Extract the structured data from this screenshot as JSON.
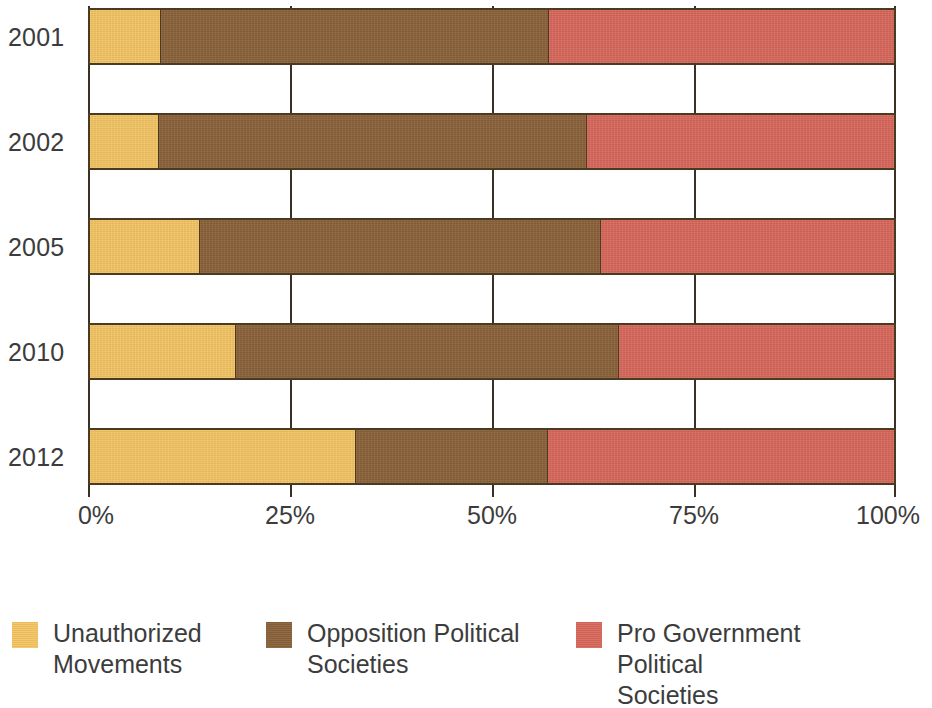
{
  "chart_data": {
    "type": "bar",
    "orientation": "horizontal",
    "stacked": true,
    "normalized": true,
    "title": "",
    "subtitle": "",
    "xlabel": "",
    "ylabel": "",
    "categories": [
      "2001",
      "2002",
      "2005",
      "2010",
      "2012"
    ],
    "xticklabels": [
      "0%",
      "25%",
      "50%",
      "75%",
      "100%"
    ],
    "xtickvalues": [
      0,
      25,
      50,
      75,
      100
    ],
    "xlim": [
      0,
      100
    ],
    "grid": true,
    "grid_axis": "x",
    "legend_position": "bottom",
    "series": [
      {
        "name": "Unauthorized Movements",
        "color": "#F5C564",
        "values": [
          8.7,
          8.5,
          13.5,
          18.0,
          33.0
        ]
      },
      {
        "name": "Opposition Political Societies",
        "color": "#8A6239",
        "values": [
          48.3,
          53.2,
          49.9,
          47.7,
          23.9
        ]
      },
      {
        "name": "Pro Government Political Societies",
        "color": "#D9685C",
        "values": [
          43.0,
          38.3,
          36.6,
          34.3,
          43.1
        ]
      }
    ]
  },
  "axis": {
    "ticks": [
      {
        "label": "0%",
        "value": 0
      },
      {
        "label": "25%",
        "value": 25
      },
      {
        "label": "50%",
        "value": 50
      },
      {
        "label": "75%",
        "value": 75
      },
      {
        "label": "100%",
        "value": 100
      }
    ],
    "years": [
      "2001",
      "2002",
      "2005",
      "2010",
      "2012"
    ]
  },
  "legend": {
    "items": [
      {
        "label": "Unauthorized\nMovements",
        "color": "#F5C564",
        "swatch_name": "legend-swatch-unauthorized-movements"
      },
      {
        "label": "Opposition Political\nSocieties",
        "color": "#8A6239",
        "swatch_name": "legend-swatch-opposition-political-societies"
      },
      {
        "label": "Pro Government Political\nSocieties",
        "color": "#D9685C",
        "swatch_name": "legend-swatch-pro-government-political-societies"
      }
    ]
  },
  "style": {
    "background": "#FFFFFF",
    "text_color": "#3C3C3C",
    "outline_color": "#4A3A22",
    "gridline_color": "#3B3024"
  }
}
